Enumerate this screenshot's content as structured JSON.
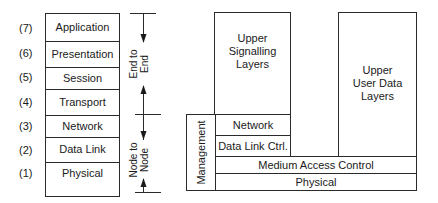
{
  "osi_stack": {
    "layers": [
      {
        "number": "(7)",
        "label": "Application"
      },
      {
        "number": "(6)",
        "label": "Presentation"
      },
      {
        "number": "(5)",
        "label": "Session"
      },
      {
        "number": "(4)",
        "label": "Transport"
      },
      {
        "number": "(3)",
        "label": "Network"
      },
      {
        "number": "(2)",
        "label": "Data Link"
      },
      {
        "number": "(1)",
        "label": "Physical"
      }
    ]
  },
  "scope_arrows": {
    "end_to_end": {
      "line1": "End to",
      "line2": "End"
    },
    "node_to_node": {
      "line1": "Node to",
      "line2": "Node"
    }
  },
  "protocol_model": {
    "upper_signalling": {
      "line1": "Upper",
      "line2": "Signalling",
      "line3": "Layers"
    },
    "upper_user_data": {
      "line1": "Upper",
      "line2": "User Data",
      "line3": "Layers"
    },
    "management": "Management",
    "network": "Network",
    "data_link_ctrl": "Data Link Ctrl.",
    "medium_access_control": "Medium Access Control",
    "physical": "Physical"
  }
}
